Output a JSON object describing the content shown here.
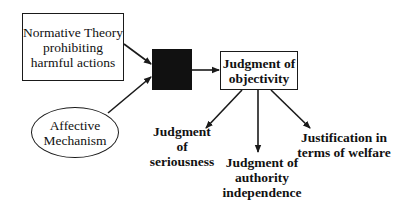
{
  "diagram": {
    "nodes": {
      "normative_theory": {
        "label": "Normative Theory\nprohibiting\nharmful actions",
        "shape": "rectangle"
      },
      "affective_mechanism": {
        "label": "Affective\nMechanism",
        "shape": "ellipse"
      },
      "integration": {
        "label": "",
        "shape": "filled-square",
        "fill": "#111111"
      },
      "objectivity": {
        "label": "Judgment of\nobjectivity",
        "shape": "rectangle"
      },
      "seriousness": {
        "label": "Judgment of\nseriousness",
        "shape": "text"
      },
      "authority": {
        "label": "Judgment of\nauthority\nindependence",
        "shape": "text"
      },
      "welfare": {
        "label": "Justification in\nterms of welfare",
        "shape": "text"
      }
    },
    "edges": [
      {
        "from": "normative_theory",
        "to": "integration"
      },
      {
        "from": "affective_mechanism",
        "to": "integration"
      },
      {
        "from": "integration",
        "to": "objectivity"
      },
      {
        "from": "objectivity",
        "to": "seriousness"
      },
      {
        "from": "objectivity",
        "to": "authority"
      },
      {
        "from": "objectivity",
        "to": "welfare"
      }
    ],
    "colors": {
      "stroke": "#1a1a1a",
      "fill_dark": "#111111",
      "background": "#ffffff"
    }
  }
}
